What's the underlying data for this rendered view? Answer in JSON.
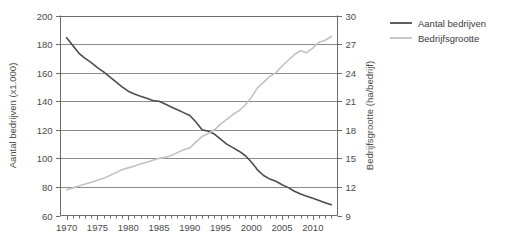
{
  "chart_data": {
    "type": "line",
    "title": "",
    "xlabel": "",
    "grid": "horizontal",
    "legend_position": "top-right",
    "x": [
      1970,
      1971,
      1972,
      1973,
      1974,
      1975,
      1976,
      1977,
      1978,
      1979,
      1980,
      1981,
      1982,
      1983,
      1984,
      1985,
      1986,
      1987,
      1988,
      1989,
      1990,
      1991,
      1992,
      1993,
      1994,
      1995,
      1996,
      1997,
      1998,
      1999,
      2000,
      2001,
      2002,
      2003,
      2004,
      2005,
      2006,
      2007,
      2008,
      2009,
      2010,
      2011,
      2012,
      2013
    ],
    "x_tick_labels": [
      "1970",
      "1975",
      "1980",
      "1985",
      "1990",
      "1995",
      "2000",
      "2005",
      "2010"
    ],
    "x_tick_values": [
      1970,
      1975,
      1980,
      1985,
      1990,
      1995,
      2000,
      2005,
      2010
    ],
    "xlim": [
      1969,
      2014
    ],
    "axes": [
      {
        "id": "left",
        "label": "Aantal bedrijven (x1.000)",
        "ylim": [
          60,
          200
        ],
        "ticks": [
          60,
          80,
          100,
          120,
          140,
          160,
          180,
          200
        ],
        "tick_labels": [
          "60",
          "80",
          "100",
          "120",
          "140",
          "160",
          "180",
          "200"
        ]
      },
      {
        "id": "right",
        "label": "Bedrijfsgrootte (ha/bedrijf)",
        "ylim": [
          9,
          30
        ],
        "ticks": [
          9,
          12,
          15,
          18,
          21,
          24,
          27,
          30
        ],
        "tick_labels": [
          "9",
          "12",
          "15",
          "18",
          "21",
          "24",
          "27",
          "30"
        ]
      }
    ],
    "series": [
      {
        "name": "Aantal bedrijven",
        "axis": "left",
        "color": "#4d4d4d",
        "width": 1.6,
        "values": [
          184.5,
          179.0,
          173.5,
          170.0,
          167.0,
          163.5,
          160.5,
          157.0,
          153.5,
          150.0,
          147.0,
          145.0,
          143.5,
          142.0,
          140.5,
          140.0,
          138.0,
          136.0,
          134.0,
          132.0,
          130.0,
          125.5,
          120.0,
          119.0,
          117.0,
          113.5,
          110.0,
          107.5,
          105.0,
          102.0,
          97.5,
          92.0,
          88.0,
          85.5,
          84.0,
          81.5,
          79.5,
          77.0,
          75.0,
          73.5,
          72.0,
          70.5,
          69.0,
          67.5
        ]
      },
      {
        "name": "Bedrijfsgrootte",
        "axis": "right",
        "color": "#c2c2c2",
        "width": 1.6,
        "values": [
          11.7,
          11.9,
          12.1,
          12.3,
          12.5,
          12.7,
          12.9,
          13.2,
          13.5,
          13.8,
          14.0,
          14.2,
          14.4,
          14.6,
          14.8,
          15.0,
          15.1,
          15.3,
          15.6,
          15.9,
          16.1,
          16.7,
          17.3,
          17.6,
          18.0,
          18.6,
          19.1,
          19.6,
          20.0,
          20.6,
          21.4,
          22.4,
          23.0,
          23.6,
          24.0,
          24.7,
          25.3,
          25.9,
          26.3,
          26.1,
          26.6,
          27.2,
          27.4,
          27.8
        ]
      }
    ]
  },
  "legend": {
    "items": [
      {
        "label": "Aantal bedrijven",
        "color": "#4d4d4d"
      },
      {
        "label": "Bedrijfsgrootte",
        "color": "#c2c2c2"
      }
    ]
  },
  "colors": {
    "axis": "#6b6b6b",
    "grid": "#8a8a8a",
    "text": "#4a4a4a",
    "series_dark": "#4d4d4d",
    "series_light": "#c2c2c2",
    "background": "#ffffff"
  }
}
